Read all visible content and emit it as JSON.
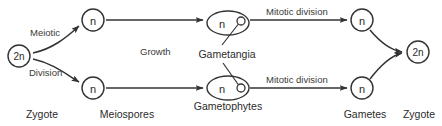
{
  "diagram": {
    "stroke_color": "#333333",
    "text_color": "#2b2b2b",
    "background_color": "#ffffff",
    "nodes": {
      "zygote_left": {
        "label": "2n",
        "x": 19,
        "y": 56,
        "r": 11
      },
      "meiospore_top": {
        "label": "n",
        "x": 93,
        "y": 20,
        "r": 11
      },
      "meiospore_bottom": {
        "label": "n",
        "x": 93,
        "y": 88,
        "r": 11
      },
      "gametophyte_top": {
        "label": "n",
        "x": 228,
        "y": 23,
        "rx": 21,
        "ry": 12
      },
      "gametophyte_bottom": {
        "label": "n",
        "x": 228,
        "y": 88,
        "rx": 21,
        "ry": 12
      },
      "gamete_top": {
        "label": "n",
        "x": 362,
        "y": 20,
        "r": 11
      },
      "gamete_bottom": {
        "label": "n",
        "x": 362,
        "y": 88,
        "r": 11
      },
      "zygote_right": {
        "label": "2n",
        "x": 418,
        "y": 52,
        "r": 11
      }
    },
    "edge_labels": {
      "meiotic": "Meiotic",
      "division": "Division",
      "growth": "Growth",
      "mitotic_division_top": "Mitotic division",
      "mitotic_division_bottom": "Mitotic division"
    },
    "structure_labels": {
      "gametangia": "Gametangia",
      "gametophytes": "Gametophytes"
    },
    "stage_labels": [
      {
        "name": "zygote-left",
        "text": "Zygote",
        "x": 42
      },
      {
        "name": "meiospores",
        "text": "Meiospores",
        "x": 127
      },
      {
        "name": "gametophytes",
        "text": "Gametophytes",
        "x": 228
      },
      {
        "name": "gametes",
        "text": "Gametes",
        "x": 365
      },
      {
        "name": "zygote-right",
        "text": "Zygote",
        "x": 419
      }
    ],
    "ghost_fragment": ""
  }
}
